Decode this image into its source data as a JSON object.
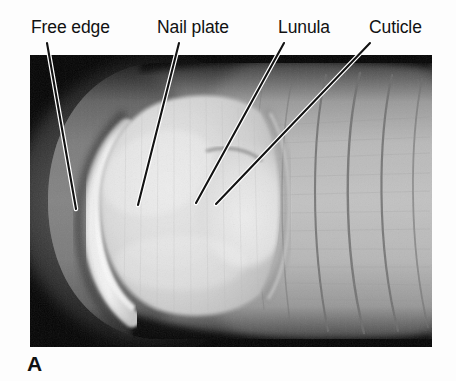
{
  "figure": {
    "panel_letter": "A",
    "background_color": "#fdfdfd",
    "photo_background_color": "#000000",
    "photo": {
      "subject": "human-fingertip-nail",
      "left": 30,
      "top": 55,
      "width": 402,
      "height": 292
    }
  },
  "annotations": [
    {
      "id": "free-edge",
      "label": "Free edge",
      "label_x": 31,
      "label_y": 16,
      "line": {
        "x1": 47,
        "y1": 43,
        "x2": 76,
        "y2": 209
      }
    },
    {
      "id": "nail-plate",
      "label": "Nail plate",
      "label_x": 157,
      "label_y": 16,
      "line": {
        "x1": 179,
        "y1": 43,
        "x2": 138,
        "y2": 205
      }
    },
    {
      "id": "lunula",
      "label": "Lunula",
      "label_x": 278,
      "label_y": 16,
      "line": {
        "x1": 284,
        "y1": 43,
        "x2": 196,
        "y2": 203
      }
    },
    {
      "id": "cuticle",
      "label": "Cuticle",
      "label_x": 369,
      "label_y": 16,
      "line": {
        "x1": 370,
        "y1": 43,
        "x2": 216,
        "y2": 204
      }
    }
  ],
  "colors": {
    "leader_line_stroke": "#121212",
    "leader_line_halo": "#ffffff",
    "text": "#111111"
  }
}
